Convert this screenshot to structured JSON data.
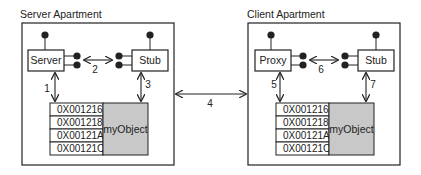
{
  "diagram": {
    "colors": {
      "line": "#222222",
      "object_fill": "#c8c8c8",
      "background": "#ffffff"
    },
    "server_apartment": {
      "title": "Server Apartment",
      "left_box": "Server",
      "right_box": "Stub",
      "link_label": "2",
      "down_left_label": "1",
      "down_right_label": "3",
      "addresses": [
        "0X001216",
        "0X001218",
        "0X00121A",
        "0X00121C"
      ],
      "object_label": "myObject"
    },
    "client_apartment": {
      "title": "Client Apartment",
      "left_box": "Proxy",
      "right_box": "Stub",
      "link_label": "6",
      "down_left_label": "5",
      "down_right_label": "7",
      "addresses": [
        "0X001216",
        "0X001218",
        "0X00121A",
        "0X00121C"
      ],
      "object_label": "myObject"
    },
    "cross_link_label": "4"
  }
}
